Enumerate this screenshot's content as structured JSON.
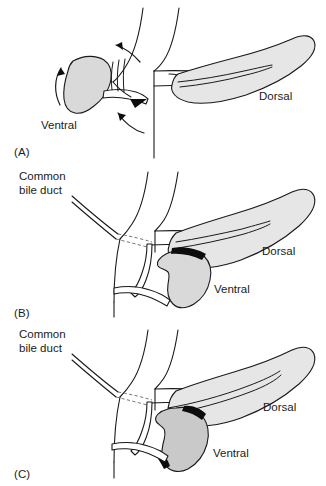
{
  "figure": {
    "background_color": "#ffffff",
    "line_color": "#1a1a1a",
    "organ_fill_color": "#d9d9d9",
    "dashed_line_color": "#777777",
    "text_color": "#1b1b1b"
  },
  "panels": [
    {
      "id": "A",
      "caption": "(A)",
      "labels": {
        "ventral": "Ventral",
        "dorsal": "Dorsal"
      },
      "annotations": {
        "rotation_arrows": 3,
        "description": "Ventral pancreatic bud begins rotation posteriorly around the duodenum toward the dorsal bud"
      }
    },
    {
      "id": "B",
      "caption": "(B)",
      "labels": {
        "common_bile_duct": "Common\nbile duct",
        "common_bile_duct_line1": "Common",
        "common_bile_duct_line2": "bile duct",
        "ventral": "Ventral",
        "dorsal": "Dorsal"
      },
      "annotations": {
        "description": "Ventral bud has rotated to lie posterior and inferior to the dorsal bud; common bile duct shown entering duodenum"
      }
    },
    {
      "id": "C",
      "caption": "(C)",
      "labels": {
        "common_bile_duct": "Common\nbile duct",
        "common_bile_duct_line1": "Common",
        "common_bile_duct_line2": "bile duct",
        "ventral": "Ventral",
        "dorsal": "Dorsal"
      },
      "annotations": {
        "description": "Ventral and dorsal pancreatic buds have fused; ducts anastomose to form the main pancreatic duct"
      }
    }
  ]
}
